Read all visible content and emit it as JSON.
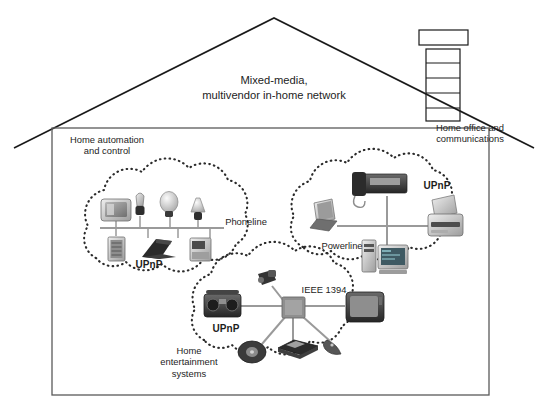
{
  "figure": {
    "kind": "house-network-diagram",
    "title_line1": "Mixed-media,",
    "title_line2": "multivendor in-home network"
  },
  "house": {
    "roof_label": "roof-outline",
    "chimney_label": "chimney",
    "chimney_brick_rows": 4,
    "wall_label": "house-wall"
  },
  "zones": [
    {
      "id": "home-automation",
      "label": "Home automation\nand control",
      "protocol": "Phoneline",
      "standard": "UPnP",
      "topology": "bus",
      "devices": [
        {
          "name": "wall-display",
          "position": "above-bus"
        },
        {
          "name": "lamp-small",
          "position": "above-bus"
        },
        {
          "name": "light-bulb",
          "position": "above-bus"
        },
        {
          "name": "table-lamp",
          "position": "above-bus"
        },
        {
          "name": "control-panel",
          "position": "below-bus"
        },
        {
          "name": "laptop",
          "position": "below-bus"
        },
        {
          "name": "appliance",
          "position": "below-bus"
        }
      ]
    },
    {
      "id": "home-office",
      "label": "Home office and\ncommunications",
      "protocol": "Powerline",
      "standard": "UPnP",
      "topology": "cross",
      "devices": [
        {
          "name": "fax-phone",
          "position": "top"
        },
        {
          "name": "laptop",
          "position": "left"
        },
        {
          "name": "desktop-pc",
          "position": "bottom"
        },
        {
          "name": "printer",
          "position": "right"
        }
      ]
    },
    {
      "id": "home-entertainment",
      "label": "Home\nentertainment\nsystems",
      "protocol": "IEEE 1394",
      "standard": "UPnP",
      "topology": "star",
      "devices": [
        {
          "name": "camcorder",
          "position": "top"
        },
        {
          "name": "stereo-boombox",
          "position": "left"
        },
        {
          "name": "television",
          "position": "right"
        },
        {
          "name": "cd-disc",
          "position": "bottom-left"
        },
        {
          "name": "vcr-player",
          "position": "bottom"
        },
        {
          "name": "remote-control",
          "position": "bottom-right"
        }
      ]
    }
  ],
  "colors": {
    "outline": "#1a1a1a",
    "cloud_dots": "#2b2b2b",
    "link": "#9a9a9a",
    "device_dark": "#3a3a3a",
    "device_mid": "#8d8d8d",
    "device_light": "#cfcfcf",
    "hub": "#8f8f8f"
  }
}
